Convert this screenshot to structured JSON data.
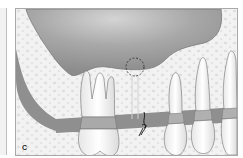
{
  "figure": {
    "panel_label": "C",
    "elements": {
      "sinus": "maxillary-sinus",
      "bone": "cancellous-alveolar-bone",
      "gingiva": "gingiva-band",
      "molar": "upper-molar",
      "premolars": [
        "premolar-1",
        "premolar-2",
        "canine"
      ],
      "marker": "dashed-circle-sinus-floor",
      "suture": "gingival-suture"
    },
    "colors": {
      "sinus": "#9a9a9a",
      "sinus_highlight": "#c8c8c8",
      "bone": "#f1f1f1",
      "bone_pores": "#dcdcdc",
      "gingiva": "#8f8f8f",
      "tooth": "#fafafa",
      "tooth_outline": "#6e6e6e",
      "frame_border": "#a9a9a9"
    }
  }
}
